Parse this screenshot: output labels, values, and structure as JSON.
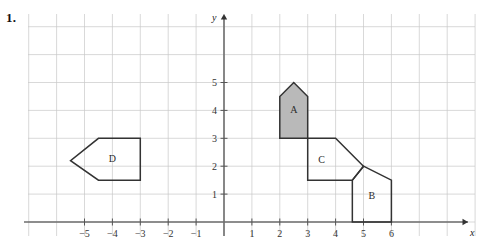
{
  "problem": {
    "number": "1."
  },
  "axes": {
    "x_label": "x",
    "y_label": "y",
    "x_ticks": [
      "-5",
      "-4",
      "-3",
      "-2",
      "-1",
      "1",
      "2",
      "3",
      "4",
      "5",
      "6"
    ],
    "y_ticks": [
      "1",
      "2",
      "3",
      "4",
      "5"
    ],
    "x_tick_values": [
      -5,
      -4,
      -3,
      -2,
      -1,
      1,
      2,
      3,
      4,
      5,
      6
    ],
    "y_tick_values": [
      1,
      2,
      3,
      4,
      5
    ],
    "x_range": [
      -7,
      9
    ],
    "y_range": [
      -0.6,
      6.4
    ],
    "grid": true,
    "grid_color": "#c9c9c9",
    "axis_color": "#6e6e6e"
  },
  "chart_data": {
    "type": "scatter",
    "title": "",
    "xlabel": "x",
    "ylabel": "y",
    "grid": true,
    "xlim": [
      -7,
      9
    ],
    "ylim": [
      -0.6,
      6.4
    ],
    "shapes": [
      {
        "label": "A",
        "kind": "pentagon-house",
        "fill": "#b9b9b9",
        "stroke": "#333333",
        "label_x": 2.5,
        "label_y": 4.0,
        "vertices": [
          [
            2,
            3
          ],
          [
            2,
            4.5
          ],
          [
            2.5,
            5
          ],
          [
            3,
            4.5
          ],
          [
            3,
            3
          ]
        ]
      },
      {
        "label": "B",
        "kind": "pentagon-house",
        "fill": "none",
        "stroke": "#333333",
        "label_x": 5.3,
        "label_y": 0.9,
        "vertices": [
          [
            4.6,
            0
          ],
          [
            4.6,
            1.5
          ],
          [
            5,
            2
          ],
          [
            6,
            1.5
          ],
          [
            6,
            0
          ]
        ]
      },
      {
        "label": "C",
        "kind": "pentagon-house",
        "fill": "none",
        "stroke": "#333333",
        "label_x": 3.5,
        "label_y": 2.2,
        "vertices": [
          [
            3,
            1.5
          ],
          [
            3,
            3
          ],
          [
            4,
            3
          ],
          [
            5,
            2
          ],
          [
            4.6,
            1.5
          ]
        ]
      },
      {
        "label": "D",
        "kind": "pentagon-left",
        "fill": "none",
        "stroke": "#333333",
        "label_x": -4.0,
        "label_y": 2.25,
        "vertices": [
          [
            -4.5,
            3
          ],
          [
            -3,
            3
          ],
          [
            -3,
            1.5
          ],
          [
            -4.5,
            1.5
          ],
          [
            -5.5,
            2.2
          ]
        ]
      }
    ]
  }
}
